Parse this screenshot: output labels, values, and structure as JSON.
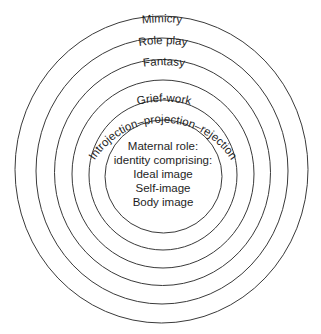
{
  "diagram": {
    "type": "concentric-rings",
    "rings": [
      {
        "label": "Mimicry",
        "cx": 161.5,
        "cy": 169.5,
        "rx": 146.5,
        "ry": 153.5
      },
      {
        "label": "Role play",
        "cx": 162,
        "cy": 171,
        "rx": 126,
        "ry": 133
      },
      {
        "label": "Fantasy",
        "cx": 162.5,
        "cy": 172.5,
        "rx": 108,
        "ry": 113
      },
      {
        "label": "Introjection–projection–rejection",
        "cx": 163,
        "cy": 174,
        "rx": 91,
        "ry": 94
      },
      {
        "label": "Grief-work",
        "cx": 163,
        "cy": 175,
        "rx": 74,
        "ry": 75
      },
      {
        "label": "",
        "cx": 163.5,
        "cy": 176.5,
        "rx": 58.5,
        "ry": 56.5
      }
    ],
    "center": {
      "lines": [
        "Maternal role:",
        "identity comprising:",
        "Ideal image",
        "Self-image",
        "Body image"
      ]
    },
    "colors": {
      "line": "#3a3a3a",
      "text": "#1e1e1e",
      "background": "#ffffff"
    }
  }
}
